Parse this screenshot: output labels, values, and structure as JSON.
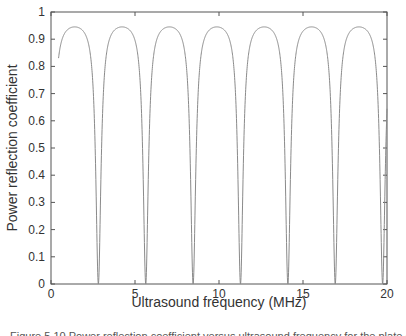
{
  "chart_data": {
    "type": "line",
    "title": "",
    "xlabel": "Ultrasound frequency (MHz)",
    "ylabel": "Power reflection coefficient",
    "xlim": [
      0,
      20
    ],
    "ylim": [
      0,
      1
    ],
    "xticks": [
      0,
      5,
      10,
      15,
      20
    ],
    "xtick_labels": [
      "0",
      "5",
      "10",
      "15",
      "20"
    ],
    "yticks": [
      0,
      0.1,
      0.2,
      0.3,
      0.4,
      0.5,
      0.6,
      0.7,
      0.8,
      0.9,
      1
    ],
    "ytick_labels": [
      "0",
      "0.1",
      "0.2",
      "0.3",
      "0.4",
      "0.5",
      "0.6",
      "0.7",
      "0.8",
      "0.9",
      "1"
    ],
    "grid": false,
    "legend": null,
    "series": [
      {
        "name": "Power reflection coefficient",
        "color": "#8a8a8a",
        "model": {
          "form": "a*s/(1+b*s), s=sin^2(pi*f/period)",
          "a": 22.78,
          "b": 23.1,
          "period": 2.82,
          "f_start": 0.45,
          "f_end": 20
        },
        "x": [
          0.45,
          0.8,
          1.0,
          1.41,
          2.0,
          2.4,
          2.6,
          2.75,
          2.82,
          2.9,
          3.1,
          3.6,
          4.23,
          5.0,
          5.64,
          6.5,
          7.05,
          8.0,
          8.46,
          9.0,
          9.87,
          11.0,
          11.28,
          12.0,
          12.69,
          13.5,
          14.1,
          15.0,
          15.51,
          16.5,
          16.92,
          17.5,
          18.33,
          19.3,
          19.74,
          19.9,
          20.0
        ],
        "y": [
          0.83,
          0.92,
          0.937,
          0.945,
          0.922,
          0.82,
          0.57,
          0.17,
          0.0,
          0.21,
          0.67,
          0.918,
          0.945,
          0.915,
          0.0,
          0.935,
          0.945,
          0.83,
          0.0,
          0.87,
          0.945,
          0.62,
          0.0,
          0.9,
          0.945,
          0.905,
          0.0,
          0.93,
          0.945,
          0.78,
          0.0,
          0.88,
          0.945,
          0.72,
          0.0,
          0.46,
          0.58
        ]
      }
    ],
    "nulls_mhz": [
      2.82,
      5.64,
      8.46,
      11.28,
      14.1,
      16.92,
      19.74
    ],
    "peak_value": 0.945
  },
  "caption": {
    "text": "Figure 5.10  Power reflection coefficient versus ultrasound frequency for the plate of one-quarter wavelength ..."
  },
  "colors": {
    "axis": "#555555",
    "curve": "#8a8a8a",
    "text": "#333333"
  }
}
